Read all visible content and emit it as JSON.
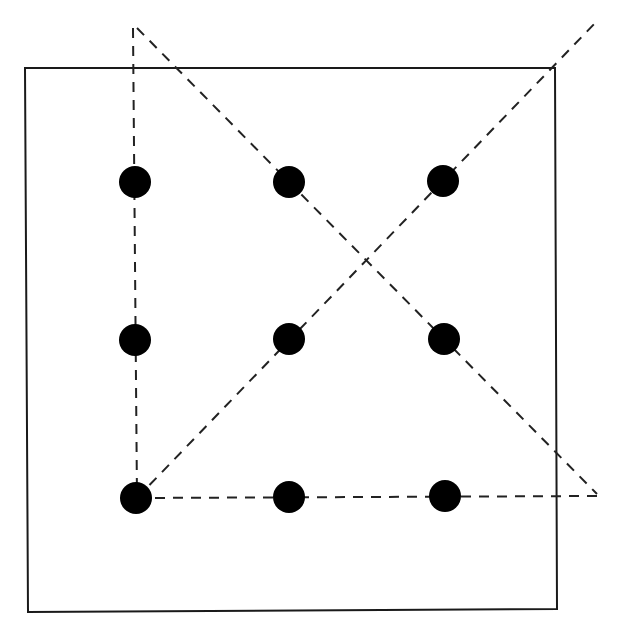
{
  "diagram": {
    "type": "nine-dots-puzzle-solution",
    "canvas": {
      "width": 619,
      "height": 638,
      "background": "#ffffff"
    },
    "box": {
      "x1": 25,
      "y1": 68,
      "x2": 555,
      "y2": 68,
      "x3": 557,
      "y3": 609,
      "x4": 28,
      "y4": 612,
      "color": "#1a1a1a"
    },
    "dot_color": "#000000",
    "dot_radius": 16,
    "dots": [
      {
        "cx": 135,
        "cy": 182
      },
      {
        "cx": 289,
        "cy": 182
      },
      {
        "cx": 443,
        "cy": 181
      },
      {
        "cx": 135,
        "cy": 340
      },
      {
        "cx": 289,
        "cy": 339
      },
      {
        "cx": 444,
        "cy": 339
      },
      {
        "cx": 136,
        "cy": 498
      },
      {
        "cx": 289,
        "cy": 497
      },
      {
        "cx": 445,
        "cy": 496
      }
    ],
    "line_color": "#222222",
    "lines": [
      {
        "name": "vertical-left",
        "x1": 133,
        "y1": 28,
        "x2": 137,
        "y2": 498
      },
      {
        "name": "diagonal-up",
        "x1": 137,
        "y1": 498,
        "x2": 598,
        "y2": 20
      },
      {
        "name": "diagonal-down",
        "x1": 137,
        "y1": 28,
        "x2": 597,
        "y2": 494
      },
      {
        "name": "horizontal-bottom",
        "x1": 137,
        "y1": 498,
        "x2": 597,
        "y2": 496
      }
    ]
  }
}
